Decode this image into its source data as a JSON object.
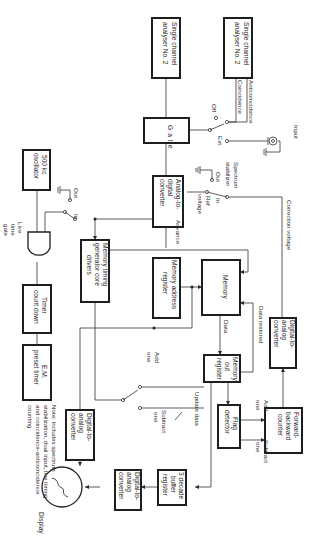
{
  "diagram": {
    "orientation": "rotated 90 degrees clockwise",
    "blocks": {
      "sca_top": [
        "Single channel",
        "analyser No. 2"
      ],
      "sca_left": [
        "Single channel",
        "analyser No. 2"
      ],
      "gate": "Gate",
      "adc": [
        "Analog-to-",
        "digital",
        "converter"
      ],
      "oscillator": [
        "500 kc",
        "oscillator"
      ],
      "timer": [
        "Timer",
        "count down"
      ],
      "em_timer": [
        "E.M.",
        "preset timer"
      ],
      "memory_timing": [
        "Memory timing",
        "generator core",
        "drivers"
      ],
      "memory_address": [
        "Memory address",
        "register"
      ],
      "memory": "Memory",
      "memory_out": [
        "Memory",
        "out",
        "register"
      ],
      "dac_correction": [
        "Digital-to-",
        "analog",
        "converter"
      ],
      "fb_counter": [
        "Forward-",
        "backward",
        "counter"
      ],
      "flag_detector": [
        "Flag",
        "detector"
      ],
      "buffer": [
        "3 decade",
        "buffer",
        "register"
      ],
      "dac_display_right": [
        "Digital-to-",
        "analog",
        "converter"
      ],
      "dac_display_left": [
        "Digital-to-",
        "analog",
        "converter"
      ],
      "display": "Display"
    },
    "labels": {
      "anticoincidence": "Anticoincidence",
      "coincidence": "Coincidence",
      "off": "Off",
      "ext": "Ext.",
      "input": "Input",
      "spectrum_stabilizer": [
        "Spectrum",
        "stabilizer"
      ],
      "out1": "Out",
      "in1": "In",
      "ref_voltage": [
        "Ref",
        "voltage"
      ],
      "correction_voltage": "Correction voltage",
      "advance": "Advance",
      "out2": "Out",
      "in2": "In",
      "live_time_gate": [
        "Live",
        "time",
        "gate"
      ],
      "data": "Data",
      "data_restored": "Data restored",
      "add_one_switch": [
        "Add",
        "one"
      ],
      "subtract_one_switch": [
        "Subtract",
        "one"
      ],
      "update_data": "Update data",
      "add_one_counter": [
        "Add",
        "one"
      ],
      "subtract_one_counter": [
        "Subtract",
        "one"
      ],
      "note": [
        "Note: Includes spectrum",
        "stabilization, dual input, live timing",
        "and coincidence-anticoincidence",
        "counting"
      ]
    }
  }
}
